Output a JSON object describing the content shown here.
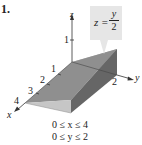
{
  "problem_number": "1.",
  "axes": {
    "x_label": "x",
    "y_label": "y",
    "z_label": "z",
    "x_ticks": [
      "1",
      "2",
      "3",
      "4"
    ],
    "y_ticks": [
      "2"
    ],
    "z_ticks": [
      "1"
    ]
  },
  "surface_label": {
    "lhs": "z =",
    "numerator": "y",
    "denominator": "2"
  },
  "region": {
    "line1": "0 ≤ x ≤ 4",
    "line2": "0 ≤ y ≤ 2"
  },
  "colors": {
    "top_face": "#8c8c8c",
    "front_face": "#c4c4c4",
    "side_face": "#6a6a6a",
    "back_face": "#b0b0b0",
    "callout_bg": "#e6e6e6",
    "axis": "#333333"
  }
}
